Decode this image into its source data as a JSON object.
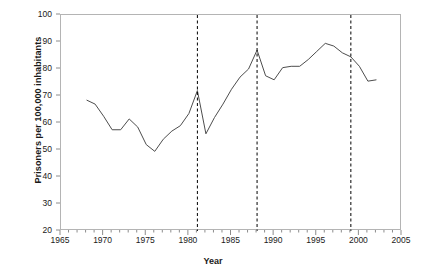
{
  "chart_data": {
    "type": "line",
    "title": "",
    "xlabel": "Year",
    "ylabel": "Prisoners per 100,000 inhabitants",
    "xlim": [
      1965,
      2005
    ],
    "ylim": [
      20,
      100
    ],
    "xticks": [
      1965,
      1970,
      1975,
      1980,
      1985,
      1990,
      1995,
      2000,
      2005
    ],
    "yticks": [
      20,
      30,
      40,
      50,
      60,
      70,
      80,
      90,
      100
    ],
    "minor_xtick_interval": 1,
    "grid": false,
    "legend": "none",
    "x": [
      1968,
      1969,
      1970,
      1971,
      1972,
      1973,
      1974,
      1975,
      1976,
      1977,
      1978,
      1979,
      1980,
      1981,
      1982,
      1983,
      1984,
      1985,
      1986,
      1987,
      1988,
      1989,
      1990,
      1991,
      1992,
      1993,
      1994,
      1995,
      1996,
      1997,
      1998,
      1999,
      2000,
      2001,
      2002
    ],
    "values": [
      68.5,
      67.0,
      62.5,
      57.5,
      57.5,
      61.5,
      58.5,
      52.0,
      49.5,
      54.0,
      57.0,
      59.0,
      63.5,
      72.0,
      56.0,
      62.0,
      67.0,
      72.5,
      77.0,
      80.0,
      87.0,
      77.5,
      76.0,
      80.5,
      81.0,
      81.0,
      83.5,
      86.5,
      89.5,
      88.5,
      86.0,
      84.5,
      81.0,
      75.5,
      76.0
    ],
    "annotations": [
      {
        "label": "Presidential Pardon",
        "year": 1981
      },
      {
        "label": "Bastille Fall Pardon",
        "year": 1988
      },
      {
        "label": "Presidential Pardon",
        "year": 1999
      }
    ],
    "line_color": "#4d4d4d",
    "event_line_color": "#000000",
    "frame_color": "#b4b4b4"
  }
}
